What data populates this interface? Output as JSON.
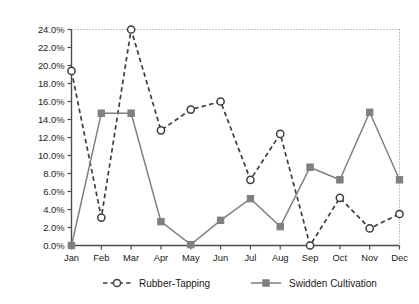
{
  "chart_data": {
    "type": "line",
    "title": "",
    "xlabel": "",
    "ylabel": "% of Total Annual Labor Performed Each Month",
    "categories": [
      "Jan",
      "Feb",
      "Mar",
      "Apr",
      "May",
      "Jun",
      "Jul",
      "Aug",
      "Sep",
      "Oct",
      "Nov",
      "Dec"
    ],
    "ylim": [
      0,
      24
    ],
    "ytick_labels": [
      "0.0%",
      "2.0%",
      "4.0%",
      "6.0%",
      "8.0%",
      "10.0%",
      "12.0%",
      "14.0%",
      "16.0%",
      "18.0%",
      "20.0%",
      "22.0%",
      "24.0%"
    ],
    "ytick_values": [
      0,
      2,
      4,
      6,
      8,
      10,
      12,
      14,
      16,
      18,
      20,
      22,
      24
    ],
    "grid": false,
    "legend_position": "bottom",
    "series": [
      {
        "name": "Rubber-Tapping",
        "line_style": "dashed",
        "marker": "open-circle",
        "color": "#3d3d3d",
        "values": [
          19.4,
          3.1,
          24.0,
          12.8,
          15.1,
          16.0,
          7.3,
          12.4,
          0.0,
          5.3,
          1.9,
          3.5
        ]
      },
      {
        "name": "Swidden Cultivation",
        "line_style": "solid",
        "marker": "filled-square",
        "color": "#7f7f7f",
        "values": [
          0.0,
          14.7,
          14.7,
          2.65,
          0.1,
          2.8,
          5.2,
          2.1,
          8.7,
          7.3,
          14.8,
          7.3
        ]
      }
    ]
  }
}
